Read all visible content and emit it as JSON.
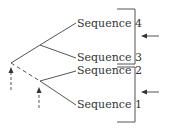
{
  "diagram": {
    "type": "phylogenetic-tree",
    "sequences": [
      {
        "label": "Sequence 4",
        "x": 77,
        "y": 18
      },
      {
        "label": "Sequence 3",
        "x": 77,
        "y": 52
      },
      {
        "label": "Sequence 2",
        "x": 77,
        "y": 65
      },
      {
        "label": "Sequence 1",
        "x": 77,
        "y": 99
      }
    ],
    "colors": {
      "line": "#555555",
      "text": "#333333"
    }
  }
}
